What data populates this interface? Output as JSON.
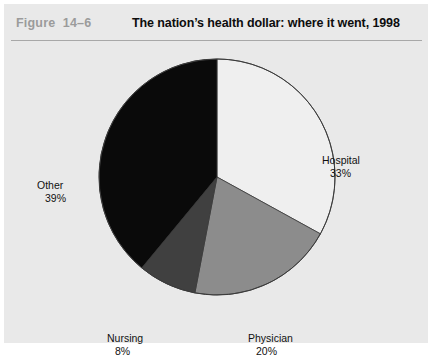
{
  "figure": {
    "number": "Figure  14–6",
    "title": "The nation’s health dollar: where it went, 1998"
  },
  "colors": {
    "panel_background": "#e9e9e9",
    "page_background": "#ffffff",
    "rule": "#a8a8a8",
    "figure_number_text": "#9b9b9b",
    "title_text": "#0d0d0d",
    "label_text": "#111111",
    "slice_outline": "#3a3a3a"
  },
  "labels": {
    "hospital": {
      "name": "Hospital",
      "value": "33%"
    },
    "physician": {
      "name": "Physician",
      "value": "20%"
    },
    "nursing": {
      "name": "Nursing",
      "value": "8%"
    },
    "other": {
      "name": "Other",
      "value": "39%"
    }
  },
  "chart_data": {
    "type": "pie",
    "title": "The nation’s health dollar: where it went, 1998",
    "subtitle": "",
    "xlabel": "",
    "ylabel": "",
    "unit": "percent",
    "start_angle_deg": 0,
    "direction": "clockwise",
    "legend": "none",
    "labels_position": "outside",
    "categories": [
      "Hospital",
      "Physician",
      "Nursing",
      "Other"
    ],
    "values": [
      33,
      20,
      8,
      39
    ],
    "value_labels": [
      "33%",
      "20%",
      "8%",
      "39%"
    ],
    "slice_colors": [
      "#efefef",
      "#8c8c8c",
      "#404040",
      "#0a0a0a"
    ],
    "total": 100,
    "center": [
      213,
      173
    ],
    "radius": 118
  }
}
